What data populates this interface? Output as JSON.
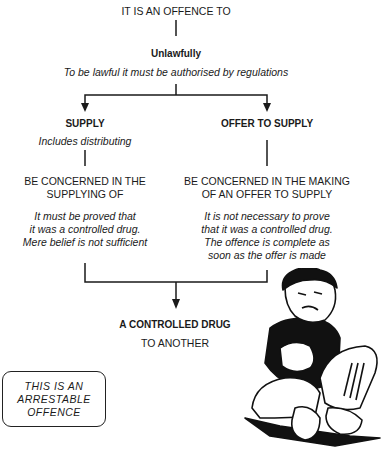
{
  "title": "IT IS AN OFFENCE TO",
  "unlawfully": {
    "heading": "Unlawfully",
    "note": "To be lawful it must be authorised by regulations"
  },
  "supply": {
    "heading": "SUPPLY",
    "note": "Includes distributing",
    "concerned": [
      "BE CONCERNED IN THE",
      "SUPPLYING OF"
    ],
    "detail": [
      "It must be proved that",
      "it was a controlled drug.",
      "Mere belief is not sufficient"
    ]
  },
  "offer": {
    "heading": "OFFER TO SUPPLY",
    "concerned": [
      "BE CONCERNED IN THE MAKING",
      "OF AN OFFER TO SUPPLY"
    ],
    "detail": [
      "It is not necessary to prove",
      "that it was a controlled drug.",
      "The offence is complete as",
      "soon as the offer is made"
    ]
  },
  "result": {
    "heading": "A CONTROLLED DRUG",
    "sub": "TO ANOTHER"
  },
  "arrestable_box": [
    "THIS IS AN",
    "ARRESTABLE",
    "OFFENCE"
  ],
  "illustration": "cartoon-boy-sitting-crosslegged"
}
